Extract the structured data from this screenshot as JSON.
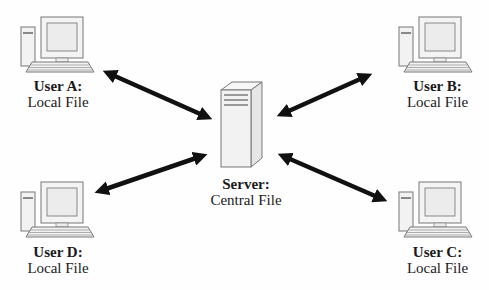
{
  "diagram": {
    "type": "client-server file distribution",
    "server": {
      "title": "Server:",
      "subtitle": "Central File",
      "icon": "server-tower-icon"
    },
    "users": [
      {
        "id": "A",
        "title": "User A:",
        "subtitle": "Local File",
        "icon": "desktop-computer-icon",
        "position": "top-left"
      },
      {
        "id": "B",
        "title": "User B:",
        "subtitle": "Local File",
        "icon": "desktop-computer-icon",
        "position": "top-right"
      },
      {
        "id": "C",
        "title": "User C:",
        "subtitle": "Local File",
        "icon": "desktop-computer-icon",
        "position": "bottom-right"
      },
      {
        "id": "D",
        "title": "User D:",
        "subtitle": "Local File",
        "icon": "desktop-computer-icon",
        "position": "bottom-left"
      }
    ],
    "connections": [
      {
        "from": "User A",
        "to": "Server",
        "direction": "bidirectional"
      },
      {
        "from": "User B",
        "to": "Server",
        "direction": "bidirectional"
      },
      {
        "from": "User C",
        "to": "Server",
        "direction": "bidirectional"
      },
      {
        "from": "User D",
        "to": "Server",
        "direction": "bidirectional"
      }
    ],
    "colors": {
      "arrow": "#111111",
      "device_fill": "#f2f2f2",
      "device_stroke": "#777777",
      "text": "#1a1a1a"
    }
  }
}
